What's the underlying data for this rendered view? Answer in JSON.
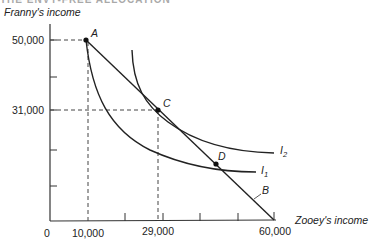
{
  "header": {
    "cut_text": "THE ENVY-FREE ALLOCATION"
  },
  "chart_data": {
    "type": "line",
    "title": "",
    "ylabel": "Franny's income",
    "xlabel": "Zooey's income",
    "xlim": [
      0,
      60000
    ],
    "ylim": [
      0,
      60000
    ],
    "origin_label": "0",
    "x_tick_labels": [
      "10,000",
      "29,000",
      "60,000"
    ],
    "x_ticks": [
      10000,
      20000,
      30000,
      40000,
      50000,
      60000
    ],
    "y_tick_labels": [
      "50,000",
      "31,000"
    ],
    "y_ticks": [
      10000,
      20000,
      31000,
      40000,
      50000
    ],
    "grid": false,
    "points": [
      {
        "label": "A",
        "x": 10000,
        "y": 50000
      },
      {
        "label": "C",
        "x": 29000,
        "y": 31000
      },
      {
        "label": "D",
        "x": 44000,
        "y": 15000
      }
    ],
    "series": [
      {
        "name": "B",
        "kind": "budget line",
        "x": [
          10000,
          60000
        ],
        "y": [
          50000,
          0
        ]
      },
      {
        "name": "I1",
        "kind": "indifference curve",
        "x": [
          10000,
          15000,
          22000,
          30000,
          38000,
          46000,
          54000
        ],
        "y": [
          50000,
          35000,
          25000,
          19000,
          15500,
          13500,
          12500
        ]
      },
      {
        "name": "I2",
        "kind": "indifference curve",
        "x": [
          22000,
          25000,
          30000,
          35000,
          42000,
          50000,
          60000
        ],
        "y": [
          47000,
          36000,
          29500,
          25000,
          21000,
          19000,
          18000
        ]
      }
    ],
    "dashed_guides": [
      {
        "from": [
          0,
          50000
        ],
        "to": [
          10000,
          50000
        ]
      },
      {
        "from": [
          10000,
          50000
        ],
        "to": [
          10000,
          0
        ]
      },
      {
        "from": [
          0,
          31000
        ],
        "to": [
          29000,
          31000
        ]
      },
      {
        "from": [
          29000,
          31000
        ],
        "to": [
          29000,
          0
        ]
      }
    ],
    "curve_labels": [
      "I2",
      "I1",
      "B"
    ]
  }
}
